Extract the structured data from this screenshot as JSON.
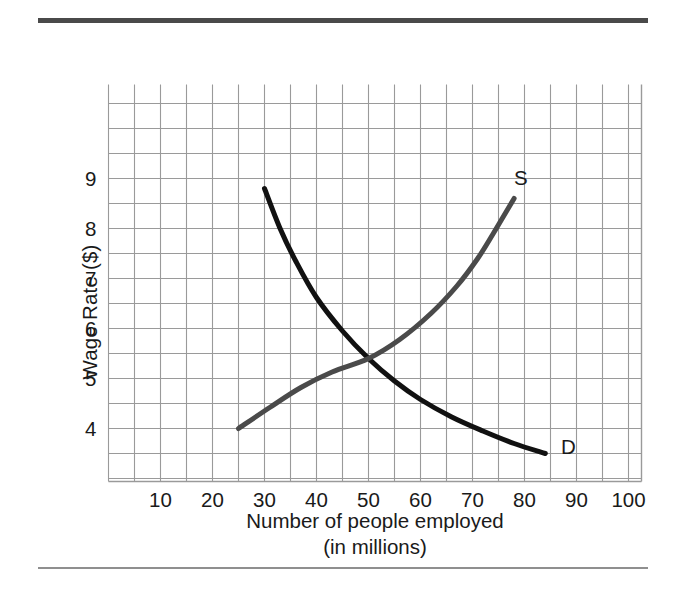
{
  "figure": {
    "top_rule_color": "#4a4a4a",
    "bottom_rule_color": "#8f8f8f",
    "background": "#ffffff"
  },
  "chart_data": {
    "type": "line",
    "title": "",
    "xlabel_line1": "Number of people employed",
    "xlabel_line2": "(in millions)",
    "ylabel": "Wage Rate ($)",
    "xlim": [
      0,
      102
    ],
    "ylim": [
      2.9,
      10.9
    ],
    "xticks": [
      10,
      20,
      30,
      40,
      50,
      60,
      70,
      80,
      90,
      100
    ],
    "xtick_labels": [
      "10",
      "20",
      "30",
      "40",
      "50",
      "60",
      "70",
      "80",
      "90",
      "100"
    ],
    "yticks": [
      4,
      5,
      6,
      7,
      8,
      9
    ],
    "ytick_labels": [
      "4",
      "5",
      "6",
      "7",
      "8",
      "9"
    ],
    "grid": true,
    "grid_color": "#9a9a9a",
    "grid_x_step": 5,
    "grid_y_step": 0.5,
    "legend_position": "inline-curve-ends",
    "equilibrium": {
      "x": 50,
      "y": 5.4,
      "note": "intersection of supply and demand"
    },
    "series": [
      {
        "name": "Demand",
        "label": "D",
        "color": "#111111",
        "width": 5,
        "label_x": 87,
        "label_y": 3.62,
        "points": [
          {
            "x": 30,
            "y": 8.8
          },
          {
            "x": 33,
            "y": 8.0
          },
          {
            "x": 36,
            "y": 7.35
          },
          {
            "x": 40,
            "y": 6.62
          },
          {
            "x": 45,
            "y": 5.95
          },
          {
            "x": 50,
            "y": 5.4
          },
          {
            "x": 55,
            "y": 4.95
          },
          {
            "x": 60,
            "y": 4.58
          },
          {
            "x": 66,
            "y": 4.23
          },
          {
            "x": 72,
            "y": 3.95
          },
          {
            "x": 78,
            "y": 3.7
          },
          {
            "x": 84,
            "y": 3.5
          }
        ]
      },
      {
        "name": "Supply",
        "label": "S",
        "color": "#4a4a4a",
        "width": 5,
        "label_x": 78,
        "label_y": 9.0,
        "points": [
          {
            "x": 25,
            "y": 4.0
          },
          {
            "x": 31,
            "y": 4.42
          },
          {
            "x": 37,
            "y": 4.82
          },
          {
            "x": 43,
            "y": 5.13
          },
          {
            "x": 50,
            "y": 5.4
          },
          {
            "x": 56,
            "y": 5.78
          },
          {
            "x": 62,
            "y": 6.3
          },
          {
            "x": 67,
            "y": 6.85
          },
          {
            "x": 71,
            "y": 7.4
          },
          {
            "x": 74,
            "y": 7.9
          },
          {
            "x": 76,
            "y": 8.25
          },
          {
            "x": 78,
            "y": 8.6
          }
        ]
      }
    ]
  }
}
